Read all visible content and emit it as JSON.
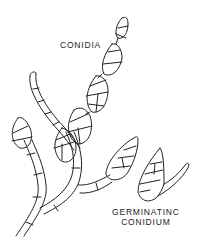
{
  "figure": {
    "labels": {
      "conidia": "CONIDIA",
      "germinating_line1": "GERMINATINC",
      "germinating_line2": "CONIDIUM"
    },
    "line_color": "#222222",
    "background": "#ffffff"
  }
}
